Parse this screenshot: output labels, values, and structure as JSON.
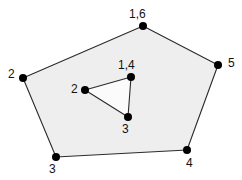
{
  "figure": {
    "kind": "geometric-diagram",
    "canvas": {
      "width": 242,
      "height": 180
    },
    "background_color": "#ffffff",
    "stroke_color": "#1a1a1a",
    "vertex_dot_color": "#000000",
    "label_color": "#111111",
    "outer_polygon": {
      "name": "outer-pentagon",
      "sides": 5,
      "fill_color": "#eeeeee",
      "stroke_color": "#2b2b2b",
      "stroke_width": 1.1,
      "points_attr": "143,26 23,78 56,157 187,150 218,65",
      "vertices": [
        {
          "id": "outer-v1",
          "label": "1,6",
          "x": 143,
          "y": 26,
          "label_x": 129,
          "label_y": 8
        },
        {
          "id": "outer-v2",
          "label": "2",
          "x": 23,
          "y": 78,
          "label_x": 8,
          "label_y": 68
        },
        {
          "id": "outer-v3",
          "label": "3",
          "x": 56,
          "y": 157,
          "label_x": 49,
          "label_y": 163
        },
        {
          "id": "outer-v4",
          "label": "4",
          "x": 187,
          "y": 150,
          "label_x": 186,
          "label_y": 157
        },
        {
          "id": "outer-v5",
          "label": "5",
          "x": 218,
          "y": 65,
          "label_x": 228,
          "label_y": 57
        }
      ]
    },
    "inner_polygon": {
      "name": "inner-triangle",
      "sides": 3,
      "fill_color": "#fbfbfb",
      "stroke_color": "#2b2b2b",
      "stroke_width": 1.1,
      "points_attr": "131,77 85,90 128,117",
      "vertices": [
        {
          "id": "inner-v1",
          "label": "1,4",
          "x": 131,
          "y": 77,
          "label_x": 118,
          "label_y": 59
        },
        {
          "id": "inner-v2",
          "label": "2",
          "x": 85,
          "y": 90,
          "label_x": 71,
          "label_y": 83
        },
        {
          "id": "inner-v3",
          "label": "3",
          "x": 128,
          "y": 117,
          "label_x": 122,
          "label_y": 123
        }
      ]
    },
    "dot_radius": 4.0
  }
}
